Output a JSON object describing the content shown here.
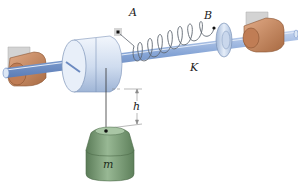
{
  "diagram": {
    "labels": {
      "A": "A",
      "B": "B",
      "K": "K",
      "h": "h",
      "m": "m"
    },
    "colors": {
      "shaft": "#7f9fd0",
      "shaft_highlight": "#c7d6f0",
      "bearing": "#c98a62",
      "bearing_dark": "#a5683f",
      "wall_plate": "#cfcfcf",
      "drum": "#dce7f5",
      "drum_shade": "#b4c6e0",
      "spring": "#5f6670",
      "mass": "#7fa07b",
      "mass_dark": "#5d7f5a",
      "cord": "#333333"
    }
  }
}
